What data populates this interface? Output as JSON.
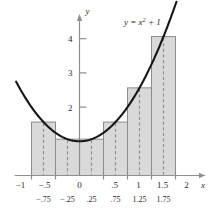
{
  "chart_data": {
    "type": "bar",
    "title": "",
    "subtitle": "",
    "xlabel": "x",
    "ylabel": "y",
    "equation_label": "y = x² + 1",
    "equation_parts": {
      "lhs": "y",
      "eq": "=",
      "base": "x",
      "exponent": "2",
      "tail": "+ 1"
    },
    "grid": false,
    "legend": null,
    "xlim": [
      -1.35,
      2.3
    ],
    "ylim": [
      0,
      4.55
    ],
    "x_tick_labels": [
      "−1",
      "−.5",
      "0",
      ".5",
      "1",
      "1.5",
      "2"
    ],
    "x_ticks": [
      -1,
      -0.5,
      0,
      0.5,
      1,
      1.5,
      2
    ],
    "midpoint_tick_labels": [
      "−.75",
      "−.25",
      ".25",
      ".75",
      "1.25",
      "1.75"
    ],
    "midpoint_ticks": [
      -0.75,
      -0.25,
      0.25,
      0.75,
      1.25,
      1.75
    ],
    "y_tick_labels": [
      "2",
      "3",
      "4"
    ],
    "y_ticks": [
      2,
      3,
      4
    ],
    "bar_width": 0.5,
    "categories": [
      "−1 to −.5",
      "−.5 to 0",
      "0 to .5",
      ".5 to 1",
      "1 to 1.5",
      "1.5 to 2"
    ],
    "bars": [
      {
        "left": -1.0,
        "right": -0.5,
        "midpoint": -0.75,
        "value": 1.5625
      },
      {
        "left": -0.5,
        "right": 0.0,
        "midpoint": -0.25,
        "value": 1.0625
      },
      {
        "left": 0.0,
        "right": 0.5,
        "midpoint": 0.25,
        "value": 1.0625
      },
      {
        "left": 0.5,
        "right": 1.0,
        "midpoint": 0.75,
        "value": 1.5625
      },
      {
        "left": 1.0,
        "right": 1.5,
        "midpoint": 1.25,
        "value": 2.5625
      },
      {
        "left": 1.5,
        "right": 2.0,
        "midpoint": 1.75,
        "value": 4.0625
      }
    ],
    "curve": {
      "name": "y = x^2 + 1",
      "formula": "x*x + 1",
      "x_from": -1.32,
      "x_to": 2.02
    },
    "colors": {
      "bar_fill": "#d9d9d9",
      "bar_stroke": "#8c8c8c",
      "midline": "#8c8c8c",
      "curve": "#161616",
      "axis": "#8f8f8f",
      "text": "#2b2b2b",
      "background": "#ffffff"
    }
  }
}
